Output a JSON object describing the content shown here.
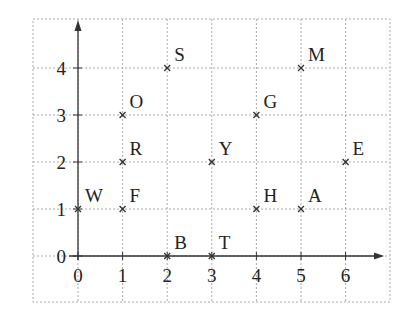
{
  "chart_data": {
    "type": "scatter",
    "title": "",
    "xlabel": "",
    "ylabel": "",
    "xlim": [
      0,
      7
    ],
    "ylim": [
      0,
      4.8
    ],
    "grid": true,
    "x_ticks": [
      "0",
      "1",
      "2",
      "3",
      "4",
      "5",
      "6"
    ],
    "y_ticks": [
      "0",
      "1",
      "2",
      "3",
      "4"
    ],
    "points": [
      {
        "label": "S",
        "x": 2,
        "y": 4
      },
      {
        "label": "M",
        "x": 5,
        "y": 4
      },
      {
        "label": "O",
        "x": 1,
        "y": 3
      },
      {
        "label": "G",
        "x": 4,
        "y": 3
      },
      {
        "label": "R",
        "x": 1,
        "y": 2
      },
      {
        "label": "Y",
        "x": 3,
        "y": 2
      },
      {
        "label": "E",
        "x": 6,
        "y": 2
      },
      {
        "label": "W",
        "x": 0,
        "y": 1
      },
      {
        "label": "F",
        "x": 1,
        "y": 1
      },
      {
        "label": "H",
        "x": 4,
        "y": 1
      },
      {
        "label": "A",
        "x": 5,
        "y": 1
      },
      {
        "label": "B",
        "x": 2,
        "y": 0
      },
      {
        "label": "T",
        "x": 3,
        "y": 0
      }
    ],
    "marker": "x",
    "colors": {
      "axis": "#333333",
      "grid": "#aaaaaa",
      "marker": "#333333",
      "text": "#222222"
    }
  }
}
